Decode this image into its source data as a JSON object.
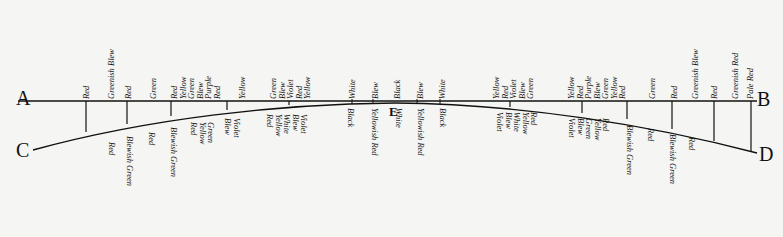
{
  "points": {
    "A": "A",
    "B": "B",
    "C": "C",
    "D": "D",
    "E": "E"
  },
  "upper_labels": [
    {
      "x": 84,
      "lines": [
        "Red"
      ]
    },
    {
      "x": 109,
      "lines": [
        "Greenish Blew"
      ]
    },
    {
      "x": 126,
      "lines": [
        "Red"
      ]
    },
    {
      "x": 151,
      "lines": [
        "Green"
      ]
    },
    {
      "x": 172,
      "lines": [
        "Red",
        "Yellow",
        "Green",
        "Blew",
        "Purple",
        "Red"
      ]
    },
    {
      "x": 240,
      "lines": [
        "Yellow"
      ]
    },
    {
      "x": 271,
      "lines": [
        "Green",
        "Blew",
        "Violet",
        "Red",
        "Yellow"
      ]
    },
    {
      "x": 350,
      "lines": [
        "White"
      ]
    },
    {
      "x": 373,
      "lines": [
        "Blew"
      ]
    },
    {
      "x": 395,
      "lines": [
        "Black"
      ]
    },
    {
      "x": 418,
      "lines": [
        "Blew"
      ]
    },
    {
      "x": 440,
      "lines": [
        "White"
      ]
    },
    {
      "x": 494,
      "lines": [
        "Yellow",
        "Red",
        "Violet",
        "Blew",
        "Green"
      ]
    },
    {
      "x": 569,
      "lines": [
        "Yellow",
        "Red",
        "Purple",
        "Blew",
        "Green",
        "Yellow",
        "Red"
      ]
    },
    {
      "x": 650,
      "lines": [
        "Green"
      ]
    },
    {
      "x": 672,
      "lines": [
        "Red"
      ]
    },
    {
      "x": 693,
      "lines": [
        "Greenish Blew"
      ]
    },
    {
      "x": 712,
      "lines": [
        "Red"
      ]
    },
    {
      "x": 733,
      "lines": [
        "Greenish Red"
      ]
    },
    {
      "x": 748,
      "lines": [
        "Pale Red"
      ]
    }
  ],
  "lower_labels": [
    {
      "x": 108,
      "y": 140,
      "lines": [
        "Red"
      ]
    },
    {
      "x": 126,
      "y": 134,
      "lines": [
        "Blewish Green"
      ]
    },
    {
      "x": 148,
      "y": 130,
      "lines": [
        "Red"
      ]
    },
    {
      "x": 170,
      "y": 125,
      "lines": [
        "Blewish Green"
      ]
    },
    {
      "x": 190,
      "y": 120,
      "lines": [
        "Red",
        "Yellow",
        "Green"
      ]
    },
    {
      "x": 224,
      "y": 116,
      "lines": [
        "Blew",
        "Violet"
      ]
    },
    {
      "x": 266,
      "y": 112,
      "lines": [
        "Red",
        "Yellow",
        "White",
        "Blew",
        "Violet"
      ]
    },
    {
      "x": 347,
      "y": 106,
      "lines": [
        "Black"
      ]
    },
    {
      "x": 371,
      "y": 106,
      "lines": [
        "Yellowish Red"
      ]
    },
    {
      "x": 395,
      "y": 106,
      "lines": [
        "White"
      ]
    },
    {
      "x": 417,
      "y": 106,
      "lines": [
        "Yellowish Red"
      ]
    },
    {
      "x": 439,
      "y": 106,
      "lines": [
        "Black"
      ]
    },
    {
      "x": 496,
      "y": 110,
      "lines": [
        "Violet",
        "Blew",
        "White",
        "Yellow",
        "Red"
      ]
    },
    {
      "x": 568,
      "y": 116,
      "lines": [
        "Violet",
        "Blew",
        "Green",
        "Yellow",
        "Red"
      ]
    },
    {
      "x": 626,
      "y": 123,
      "lines": [
        "Blewish Green"
      ]
    },
    {
      "x": 647,
      "y": 126,
      "lines": [
        "Red"
      ]
    },
    {
      "x": 669,
      "y": 132,
      "lines": [
        "Blewish Green"
      ]
    },
    {
      "x": 688,
      "y": 135,
      "lines": [
        "Red"
      ]
    }
  ]
}
